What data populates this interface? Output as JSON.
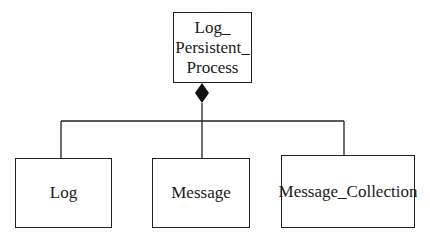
{
  "diagram": {
    "type": "uml-class-composition",
    "parent": {
      "label_lines": [
        "Log_",
        "Persistent_",
        "Process"
      ],
      "name": "Log_Persistent_Process"
    },
    "relationship": "composition",
    "children": [
      {
        "label": "Log"
      },
      {
        "label": "Message"
      },
      {
        "label": "Message_Collection"
      }
    ],
    "colors": {
      "stroke": "#222222",
      "fill": "#ffffff"
    }
  }
}
